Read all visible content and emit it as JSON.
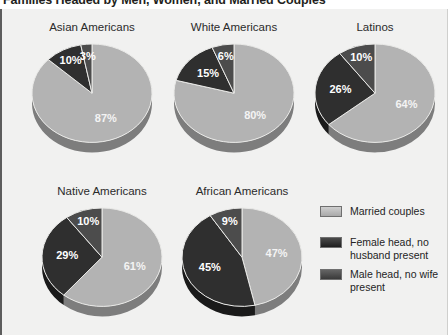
{
  "figure": {
    "title": "Families Headed by Men, Women, and Married Couples"
  },
  "colors": {
    "married": "#b3b3b3",
    "female_head": "#333333",
    "male_head": "#4a4a4a",
    "background": "#f1f1f0",
    "text": "#2b2b2b"
  },
  "legend": {
    "items": [
      {
        "label": "Married couples",
        "color": "#b3b3b3"
      },
      {
        "label": "Female head, no husband present",
        "color": "#2e2e2e"
      },
      {
        "label": "Male head, no wife present",
        "color": "#4a4a4a"
      }
    ]
  },
  "chart_data": {
    "type": "pie",
    "title": "Families Headed by Men, Women, and Married Couples",
    "unit": "%",
    "legend_position": "right",
    "series_names": [
      "Married couples",
      "Female head, no husband present",
      "Male head, no wife present"
    ],
    "charts": [
      {
        "title": "Asian Americans",
        "categories": [
          "Married couples",
          "Female head, no husband present",
          "Male head, no wife present"
        ],
        "values": [
          87,
          10,
          3
        ],
        "labels": [
          "87%",
          "10%",
          "3%"
        ]
      },
      {
        "title": "White Americans",
        "categories": [
          "Married couples",
          "Female head, no husband present",
          "Male head, no wife present"
        ],
        "values": [
          80,
          15,
          6
        ],
        "labels": [
          "80%",
          "15%",
          "6%"
        ]
      },
      {
        "title": "Latinos",
        "categories": [
          "Married couples",
          "Female head, no husband present",
          "Male head, no wife present"
        ],
        "values": [
          64,
          26,
          10
        ],
        "labels": [
          "64%",
          "26%",
          "10%"
        ]
      },
      {
        "title": "Native Americans",
        "categories": [
          "Married couples",
          "Female head, no husband present",
          "Male head, no wife present"
        ],
        "values": [
          61,
          29,
          10
        ],
        "labels": [
          "61%",
          "29%",
          "10%"
        ]
      },
      {
        "title": "African Americans",
        "categories": [
          "Married couples",
          "Female head, no husband present",
          "Male head, no wife present"
        ],
        "values": [
          47,
          45,
          9
        ],
        "labels": [
          "47%",
          "45%",
          "9%"
        ]
      }
    ]
  }
}
